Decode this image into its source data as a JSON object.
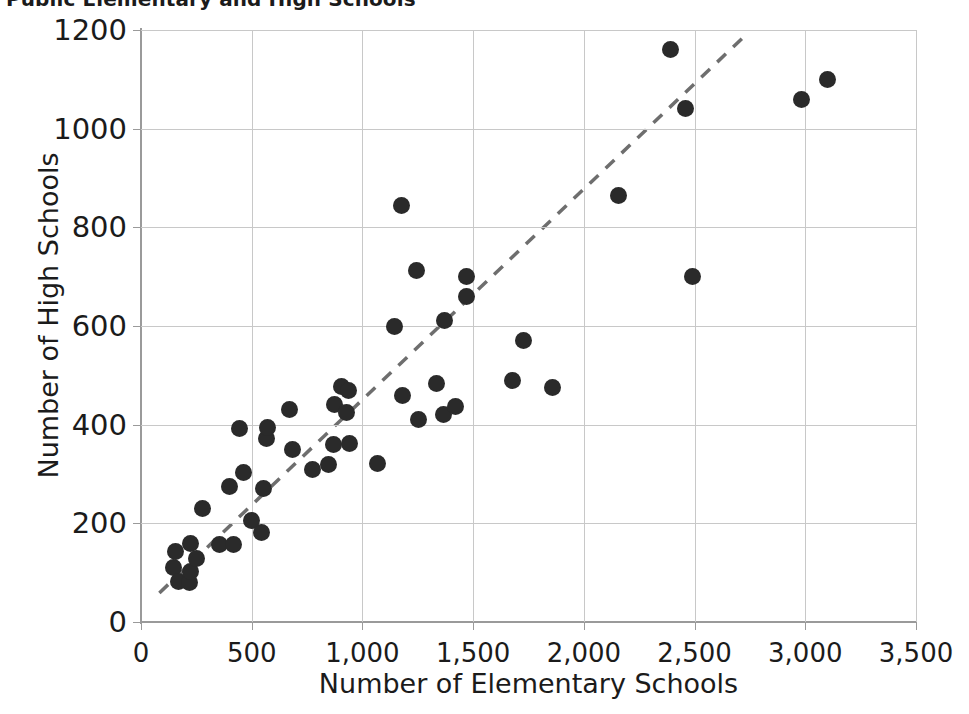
{
  "chart_data": {
    "type": "scatter",
    "title": "Public Elementary and High Schools",
    "xlabel": "Number of Elementary Schools",
    "ylabel": "Number of High Schools",
    "xlim": [
      0,
      3500
    ],
    "ylim": [
      0,
      1200
    ],
    "xticks": [
      0,
      500,
      1000,
      1500,
      2000,
      2500,
      3000,
      3500
    ],
    "xtick_labels": [
      "0",
      "500",
      "1,000",
      "1,500",
      "2,000",
      "2,500",
      "3,000",
      "3,500"
    ],
    "yticks": [
      0,
      200,
      400,
      600,
      800,
      1000,
      1200
    ],
    "ytick_labels": [
      "0",
      "200",
      "400",
      "600",
      "800",
      "1000",
      "1200"
    ],
    "grid": true,
    "legend": "none",
    "marker_color": "#2a2a2a",
    "grid_color": "#c8c8c8",
    "axis_color": "#9a9a9a",
    "trendline": {
      "style": "dashed",
      "color": "#6e6e6e",
      "x_start": 83,
      "y_start": 59,
      "x_end": 2743,
      "y_end": 1195
    },
    "points": [
      {
        "x": 147,
        "y": 110
      },
      {
        "x": 156,
        "y": 142
      },
      {
        "x": 170,
        "y": 82
      },
      {
        "x": 218,
        "y": 80
      },
      {
        "x": 222,
        "y": 102
      },
      {
        "x": 224,
        "y": 160
      },
      {
        "x": 251,
        "y": 128
      },
      {
        "x": 278,
        "y": 230
      },
      {
        "x": 355,
        "y": 158
      },
      {
        "x": 400,
        "y": 275
      },
      {
        "x": 418,
        "y": 158
      },
      {
        "x": 445,
        "y": 393
      },
      {
        "x": 462,
        "y": 303
      },
      {
        "x": 500,
        "y": 205
      },
      {
        "x": 545,
        "y": 182
      },
      {
        "x": 555,
        "y": 270
      },
      {
        "x": 566,
        "y": 372
      },
      {
        "x": 572,
        "y": 395
      },
      {
        "x": 672,
        "y": 430
      },
      {
        "x": 682,
        "y": 350
      },
      {
        "x": 775,
        "y": 310
      },
      {
        "x": 845,
        "y": 320
      },
      {
        "x": 870,
        "y": 360
      },
      {
        "x": 875,
        "y": 440
      },
      {
        "x": 905,
        "y": 478
      },
      {
        "x": 930,
        "y": 425
      },
      {
        "x": 935,
        "y": 470
      },
      {
        "x": 940,
        "y": 362
      },
      {
        "x": 1070,
        "y": 322
      },
      {
        "x": 1143,
        "y": 600
      },
      {
        "x": 1178,
        "y": 845
      },
      {
        "x": 1180,
        "y": 460
      },
      {
        "x": 1245,
        "y": 712
      },
      {
        "x": 1252,
        "y": 410
      },
      {
        "x": 1333,
        "y": 483
      },
      {
        "x": 1366,
        "y": 420
      },
      {
        "x": 1369,
        "y": 612
      },
      {
        "x": 1420,
        "y": 437
      },
      {
        "x": 1471,
        "y": 660
      },
      {
        "x": 1471,
        "y": 700
      },
      {
        "x": 1676,
        "y": 490
      },
      {
        "x": 1727,
        "y": 570
      },
      {
        "x": 1857,
        "y": 475
      },
      {
        "x": 2157,
        "y": 865
      },
      {
        "x": 2390,
        "y": 1160
      },
      {
        "x": 2457,
        "y": 1040
      },
      {
        "x": 2490,
        "y": 700
      },
      {
        "x": 2982,
        "y": 1060
      },
      {
        "x": 3100,
        "y": 1100
      }
    ]
  }
}
